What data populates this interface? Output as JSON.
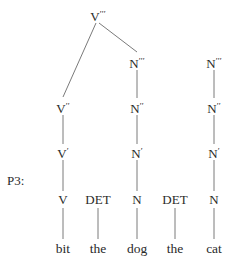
{
  "diagram": {
    "label": "P3:",
    "nodes": {
      "vbar3": {
        "cat": "V",
        "primes": "′′′",
        "x": 98,
        "y": 15
      },
      "nbar3_obj": {
        "cat": "N",
        "primes": "′′′",
        "x": 137,
        "y": 62
      },
      "nbar3_free": {
        "cat": "N",
        "primes": "′′′",
        "x": 214,
        "y": 62
      },
      "vbar2": {
        "cat": "V",
        "primes": "′′",
        "x": 63,
        "y": 107
      },
      "nbar2_obj": {
        "cat": "N",
        "primes": "′′",
        "x": 137,
        "y": 107
      },
      "nbar2_free": {
        "cat": "N",
        "primes": "′′",
        "x": 214,
        "y": 107
      },
      "vbar1": {
        "cat": "V",
        "primes": "′",
        "x": 63,
        "y": 152
      },
      "nbar1_obj": {
        "cat": "N",
        "primes": "′",
        "x": 137,
        "y": 152
      },
      "nbar1_free": {
        "cat": "N",
        "primes": "′",
        "x": 214,
        "y": 152
      },
      "v": {
        "cat": "V",
        "primes": "",
        "x": 63,
        "y": 200
      },
      "det1": {
        "cat": "DET",
        "primes": "",
        "x": 98,
        "y": 200
      },
      "n_obj": {
        "cat": "N",
        "primes": "",
        "x": 137,
        "y": 200
      },
      "det2": {
        "cat": "DET",
        "primes": "",
        "x": 175,
        "y": 200
      },
      "n_free": {
        "cat": "N",
        "primes": "",
        "x": 214,
        "y": 200
      }
    },
    "words": [
      {
        "text": "bit",
        "x": 63,
        "y": 249
      },
      {
        "text": "the",
        "x": 98,
        "y": 249
      },
      {
        "text": "dog",
        "x": 137,
        "y": 249
      },
      {
        "text": "the",
        "x": 175,
        "y": 249
      },
      {
        "text": "cat",
        "x": 214,
        "y": 249
      }
    ],
    "edges": [
      {
        "from": "V′′′",
        "to": "V′′",
        "x1": 96,
        "y1": 23,
        "x2": 63,
        "y2": 97
      },
      {
        "from": "V′′′",
        "to": "N′′′",
        "x1": 99,
        "y1": 23,
        "x2": 137,
        "y2": 52
      },
      {
        "from": "N′′′",
        "to": "N′′",
        "x1": 137,
        "y1": 70,
        "x2": 137,
        "y2": 98
      },
      {
        "from": "N′′′",
        "to": "N′′",
        "x1": 214,
        "y1": 70,
        "x2": 214,
        "y2": 98
      },
      {
        "from": "V′′",
        "to": "V′",
        "x1": 63,
        "y1": 115,
        "x2": 63,
        "y2": 144
      },
      {
        "from": "N′′",
        "to": "N′",
        "x1": 137,
        "y1": 115,
        "x2": 137,
        "y2": 144
      },
      {
        "from": "N′′",
        "to": "N′",
        "x1": 214,
        "y1": 115,
        "x2": 214,
        "y2": 144
      },
      {
        "from": "V′",
        "to": "V",
        "x1": 63,
        "y1": 160,
        "x2": 63,
        "y2": 191
      },
      {
        "from": "N′",
        "to": "N",
        "x1": 137,
        "y1": 160,
        "x2": 137,
        "y2": 191
      },
      {
        "from": "N′",
        "to": "N",
        "x1": 214,
        "y1": 160,
        "x2": 214,
        "y2": 191
      },
      {
        "from": "V",
        "to": "bit",
        "x1": 63,
        "y1": 208,
        "x2": 63,
        "y2": 239
      },
      {
        "from": "DET",
        "to": "the",
        "x1": 98,
        "y1": 208,
        "x2": 98,
        "y2": 239
      },
      {
        "from": "N",
        "to": "dog",
        "x1": 137,
        "y1": 208,
        "x2": 137,
        "y2": 239
      },
      {
        "from": "DET",
        "to": "the",
        "x1": 175,
        "y1": 208,
        "x2": 175,
        "y2": 239
      },
      {
        "from": "N",
        "to": "cat",
        "x1": 214,
        "y1": 208,
        "x2": 214,
        "y2": 239
      }
    ],
    "line_color": "#7a7a7a",
    "text_color": "#2a2a2a"
  }
}
